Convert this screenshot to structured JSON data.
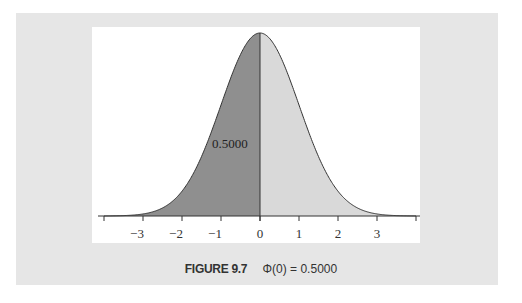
{
  "caption": {
    "figure_label": "FIGURE 9.7",
    "formula": "Φ(0) = 0.5000"
  },
  "colors": {
    "panel_bg": "#e6e6e6",
    "plot_bg": "#ffffff",
    "shaded_left": "#8f8f8f",
    "shaded_right": "#d9d9d9",
    "curve": "#333333"
  },
  "chart_data": {
    "type": "area",
    "title": "FIGURE 9.7 Φ(0) = 0.5000",
    "distribution": "standard normal",
    "x_range": [
      -4,
      4
    ],
    "tick_values": [
      -4,
      -3,
      -2,
      -1,
      0,
      1,
      2,
      3,
      4
    ],
    "tick_labels": [
      "",
      "−3",
      "−2",
      "−1",
      "0",
      "1",
      "2",
      "3",
      ""
    ],
    "shaded_regions": [
      {
        "from": -4,
        "to": 0,
        "area": 0.5,
        "label": "0.5000",
        "shade": "dark"
      },
      {
        "from": 0,
        "to": 4,
        "area": 0.5,
        "label": "",
        "shade": "light"
      }
    ],
    "cutoff": 0,
    "area_label": "0.5000",
    "xlabel": "",
    "ylabel": "",
    "grid": false,
    "legend": "none"
  }
}
